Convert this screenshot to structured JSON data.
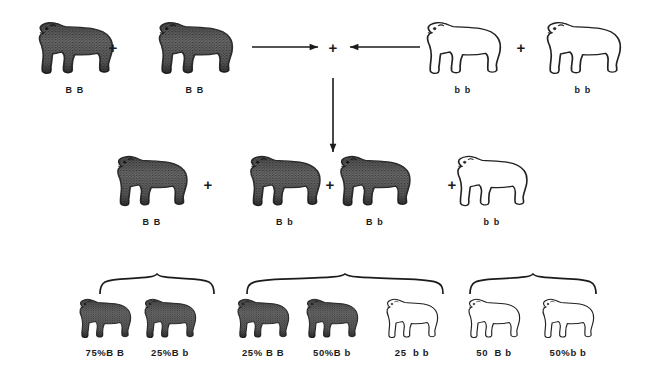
{
  "diagram": {
    "colors": {
      "ink": "#1b1b1b",
      "dark_coat": "#5a5a5a",
      "dark_coat_shadow": "#2e2e2e",
      "light_coat": "#ffffff",
      "outline": "#222222",
      "background": "#ffffff"
    },
    "rows": {
      "parents": {
        "name": "parent-generation",
        "dogs": [
          {
            "id": "p1",
            "genotype": "B B",
            "coat": "dark",
            "x": 75,
            "y": 18,
            "w": 95,
            "h": 60
          },
          {
            "id": "p2",
            "genotype": "B B",
            "coat": "dark",
            "x": 195,
            "y": 18,
            "w": 95,
            "h": 60
          },
          {
            "id": "p3",
            "genotype": "b b",
            "coat": "light",
            "x": 463,
            "y": 18,
            "w": 95,
            "h": 60
          },
          {
            "id": "p4",
            "genotype": "b b",
            "coat": "light",
            "x": 583,
            "y": 18,
            "w": 95,
            "h": 60
          }
        ],
        "plus_signs": [
          {
            "label": "+",
            "x": 113,
            "y": 47
          },
          {
            "label": "+",
            "x": 333,
            "y": 47
          },
          {
            "label": "+",
            "x": 521,
            "y": 47
          }
        ],
        "arrows": [
          {
            "id": "arrow-right",
            "direction": "right",
            "x1": 252,
            "y1": 47,
            "x2": 318,
            "y2": 47
          },
          {
            "id": "arrow-left",
            "direction": "left",
            "x1": 420,
            "y1": 47,
            "x2": 350,
            "y2": 47
          },
          {
            "id": "arrow-down",
            "direction": "down",
            "x1": 333,
            "y1": 78,
            "x2": 333,
            "y2": 152
          }
        ]
      },
      "offspring": {
        "name": "f1-generation",
        "dogs": [
          {
            "id": "f1",
            "genotype": "B B",
            "coat": "dark",
            "x": 152,
            "y": 152,
            "w": 90,
            "h": 58
          },
          {
            "id": "f2",
            "genotype": "B b",
            "coat": "dark",
            "x": 285,
            "y": 152,
            "w": 90,
            "h": 58
          },
          {
            "id": "f3",
            "genotype": "B b",
            "coat": "dark",
            "x": 375,
            "y": 152,
            "w": 90,
            "h": 58
          },
          {
            "id": "f4",
            "genotype": "b b",
            "coat": "light",
            "x": 492,
            "y": 152,
            "w": 90,
            "h": 58
          }
        ],
        "plus_signs": [
          {
            "label": "+",
            "x": 208,
            "y": 184
          },
          {
            "label": "+",
            "x": 330,
            "y": 184
          },
          {
            "label": "+",
            "x": 452,
            "y": 184
          }
        ]
      },
      "ratios": {
        "name": "ratio-summary",
        "dogs": [
          {
            "id": "r1",
            "label": "75%B B",
            "coat": "dark",
            "x": 105,
            "y": 296,
            "w": 66,
            "h": 45
          },
          {
            "id": "r2",
            "label": "25%B b",
            "coat": "dark",
            "x": 170,
            "y": 296,
            "w": 66,
            "h": 45
          },
          {
            "id": "r3",
            "label": "25% B B",
            "coat": "dark",
            "x": 263,
            "y": 296,
            "w": 66,
            "h": 45
          },
          {
            "id": "r4",
            "label": "50%B b",
            "coat": "dark",
            "x": 332,
            "y": 296,
            "w": 66,
            "h": 45
          },
          {
            "id": "r5",
            "label": "25  b b",
            "coat": "light",
            "x": 412,
            "y": 296,
            "w": 66,
            "h": 45
          },
          {
            "id": "r6",
            "label": "50  B b",
            "coat": "light",
            "x": 494,
            "y": 296,
            "w": 66,
            "h": 45
          },
          {
            "id": "r7",
            "label": "50%b b",
            "coat": "light",
            "x": 568,
            "y": 296,
            "w": 66,
            "h": 45
          }
        ],
        "braces": [
          {
            "id": "brace-1",
            "x": 98,
            "y": 272,
            "w": 118,
            "h": 22
          },
          {
            "id": "brace-2",
            "x": 245,
            "y": 272,
            "w": 200,
            "h": 22
          },
          {
            "id": "brace-3",
            "x": 468,
            "y": 272,
            "w": 130,
            "h": 22
          }
        ]
      }
    }
  }
}
